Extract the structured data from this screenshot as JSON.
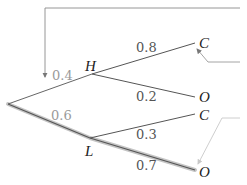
{
  "diagram": {
    "type": "probability-tree",
    "root": {
      "x": 8,
      "y": 104
    },
    "nodes": {
      "H": {
        "label": "H",
        "x": 92,
        "y": 74
      },
      "L": {
        "label": "L",
        "x": 90,
        "y": 138
      }
    },
    "branches": [
      {
        "from": "root",
        "to": "H",
        "prob": "0.4"
      },
      {
        "from": "root",
        "to": "L",
        "prob": "0.6"
      },
      {
        "from": "H",
        "to": "C",
        "prob": "0.8",
        "leaf": "C"
      },
      {
        "from": "H",
        "to": "O",
        "prob": "0.2",
        "leaf": "O"
      },
      {
        "from": "L",
        "to": "C",
        "prob": "0.3",
        "leaf": "C"
      },
      {
        "from": "L",
        "to": "O",
        "prob": "0.7",
        "leaf": "O"
      }
    ],
    "labels": {
      "p_root_H": "0.4",
      "p_root_L": "0.6",
      "p_H_C": "0.8",
      "p_H_O": "0.2",
      "p_L_C": "0.3",
      "p_L_O": "0.7",
      "node_H": "H",
      "node_L": "L",
      "leaf_HC": "C",
      "leaf_HO": "O",
      "leaf_LC": "C",
      "leaf_LO": "O"
    },
    "highlighted_path": [
      "root",
      "L",
      "O"
    ],
    "colors": {
      "line": "#555555",
      "highlight": "#b0b0b0",
      "light_label": "#9a9a9a",
      "arrow_light": "#c8c8c8"
    }
  }
}
